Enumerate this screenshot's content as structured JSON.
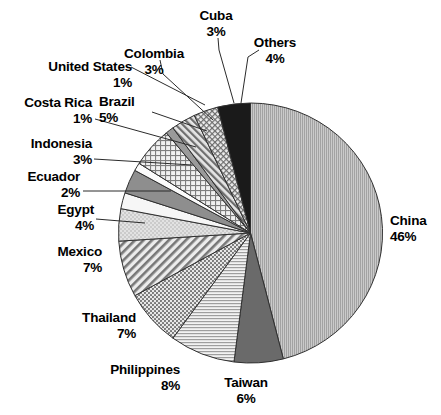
{
  "chart_data": {
    "type": "pie",
    "title": "",
    "xlabel": "",
    "ylabel": "",
    "legend_position": "none",
    "grid": false,
    "start_angle_deg": 0,
    "direction": "clockwise",
    "categories": [
      "China",
      "Taiwan",
      "Philippines",
      "Thailand",
      "Mexico",
      "Egypt",
      "Ecuador",
      "Indonesia",
      "Costa Rica",
      "Brazil",
      "United States",
      "Colombia",
      "Cuba",
      "Others"
    ],
    "values": [
      46,
      6,
      8,
      7,
      7,
      4,
      2,
      3,
      1,
      5,
      1,
      3,
      3,
      4
    ],
    "unit": "%",
    "total": 100,
    "slices": [
      {
        "name": "China",
        "value": 46,
        "pct_label": "46%",
        "pattern": "vertical-fine-lines",
        "fill": "#b6b6b6",
        "label_pos": "right"
      },
      {
        "name": "Taiwan",
        "value": 6,
        "pct_label": "6%",
        "pattern": "solid-dark-gray",
        "fill": "#6a6a6a",
        "label_pos": "bottom"
      },
      {
        "name": "Philippines",
        "value": 8,
        "pct_label": "8%",
        "pattern": "horizontal-fine-lines",
        "fill": "#dcdcdc",
        "label_pos": "bottom-left"
      },
      {
        "name": "Thailand",
        "value": 7,
        "pct_label": "7%",
        "pattern": "dotted-grid",
        "fill": "#a9a9a9",
        "label_pos": "left"
      },
      {
        "name": "Mexico",
        "value": 7,
        "pct_label": "7%",
        "pattern": "diagonal-hatch",
        "fill": "#c2c2c2",
        "label_pos": "left"
      },
      {
        "name": "Egypt",
        "value": 4,
        "pct_label": "4%",
        "pattern": "light-stipple",
        "fill": "#d2d2d2",
        "label_pos": "left"
      },
      {
        "name": "Ecuador",
        "value": 2,
        "pct_label": "2%",
        "pattern": "solid-white",
        "fill": "#f4f4f4",
        "label_pos": "left"
      },
      {
        "name": "Indonesia",
        "value": 3,
        "pct_label": "3%",
        "pattern": "solid-mid-gray",
        "fill": "#8e8e8e",
        "label_pos": "left"
      },
      {
        "name": "Costa Rica",
        "value": 1,
        "pct_label": "1%",
        "pattern": "solid-white-thin",
        "fill": "#fafafa",
        "label_pos": "left"
      },
      {
        "name": "Brazil",
        "value": 5,
        "pct_label": "5%",
        "pattern": "checker-grid",
        "fill": "#cfcfcf",
        "label_pos": "top-left"
      },
      {
        "name": "United States",
        "value": 1,
        "pct_label": "1%",
        "pattern": "solid-gray-thin",
        "fill": "#9a9a9a",
        "label_pos": "top-left"
      },
      {
        "name": "Colombia",
        "value": 3,
        "pct_label": "3%",
        "pattern": "diagonal-hatch-dense",
        "fill": "#b0b0b0",
        "label_pos": "top"
      },
      {
        "name": "Cuba",
        "value": 3,
        "pct_label": "3%",
        "pattern": "cross-hatch",
        "fill": "#c4c4c4",
        "label_pos": "top"
      },
      {
        "name": "Others",
        "value": 4,
        "pct_label": "4%",
        "pattern": "solid-black",
        "fill": "#1a1a1a",
        "label_pos": "top"
      }
    ]
  },
  "labels": {
    "cuba": {
      "name": "Cuba",
      "pct": "3%"
    },
    "others": {
      "name": "Others",
      "pct": "4%"
    },
    "colombia": {
      "name": "Colombia",
      "pct": "3%"
    },
    "united_states": {
      "name": "United States",
      "pct": "1%"
    },
    "brazil": {
      "name": "Brazil",
      "pct": "5%"
    },
    "costa_rica": {
      "name": "Costa Rica",
      "pct": "1%"
    },
    "indonesia": {
      "name": "Indonesia",
      "pct": "3%"
    },
    "ecuador": {
      "name": "Ecuador",
      "pct": "2%"
    },
    "egypt": {
      "name": "Egypt",
      "pct": "4%"
    },
    "mexico": {
      "name": "Mexico",
      "pct": "7%"
    },
    "thailand": {
      "name": "Thailand",
      "pct": "7%"
    },
    "philippines": {
      "name": "Philippines",
      "pct": "8%"
    },
    "taiwan": {
      "name": "Taiwan",
      "pct": "6%"
    },
    "china": {
      "name": "China",
      "pct": "46%"
    }
  },
  "colors": {
    "outline": "#303030",
    "background": "#ffffff",
    "text": "#000000"
  }
}
